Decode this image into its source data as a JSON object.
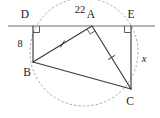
{
  "diagram": {
    "kind": "circle-geometry-figure",
    "background_color": "#ffffff",
    "stroke_color": "#3a3a3a",
    "dashed_color": "#9a9a9a",
    "label_color": "#1a1a1a",
    "vertices": [
      {
        "id": "D",
        "label": "D",
        "x": 33.0,
        "y": 26.0,
        "label_x": 25.0,
        "label_y": 15.0
      },
      {
        "id": "A",
        "label": "A",
        "x": 92.0,
        "y": 26.0,
        "label_x": 91.0,
        "label_y": 15.0
      },
      {
        "id": "E",
        "label": "E",
        "x": 131.0,
        "y": 26.0,
        "label_x": 131.0,
        "label_y": 15.0
      },
      {
        "id": "B",
        "label": "B",
        "x": 33.0,
        "y": 62.0,
        "label_x": 27.0,
        "label_y": 73.0
      },
      {
        "id": "C",
        "label": "C",
        "x": 131.0,
        "y": 89.0,
        "label_x": 130.0,
        "label_y": 102.0
      }
    ],
    "segments": [
      {
        "id": "DAE-baseline",
        "name": "baseline-through-D-A-E",
        "x1": 8.0,
        "y1": 26.0,
        "x2": 155.0,
        "y2": 26.0,
        "style": "baseline"
      },
      {
        "id": "DB",
        "name": "segment-DB",
        "x1": 33.0,
        "y1": 26.0,
        "x2": 33.0,
        "y2": 62.0,
        "style": "solid"
      },
      {
        "id": "EC",
        "name": "segment-EC",
        "x1": 131.0,
        "y1": 26.0,
        "x2": 131.0,
        "y2": 89.0,
        "style": "solid"
      },
      {
        "id": "AB",
        "name": "segment-AB",
        "x1": 92.0,
        "y1": 26.0,
        "x2": 33.0,
        "y2": 62.0,
        "style": "solid"
      },
      {
        "id": "AC",
        "name": "segment-AC",
        "x1": 92.0,
        "y1": 26.0,
        "x2": 131.0,
        "y2": 89.0,
        "style": "solid"
      },
      {
        "id": "BC",
        "name": "segment-BC",
        "x1": 33.0,
        "y1": 62.0,
        "x2": 131.0,
        "y2": 89.0,
        "style": "solid"
      }
    ],
    "arc": {
      "name": "circumscribing-dashed-arc",
      "center_x": 84.0,
      "center_y": 52.0,
      "radius": 54.0,
      "style": "dashed"
    },
    "right_angles": [
      {
        "id": "angle-D",
        "name": "right-angle-at-D",
        "x": 33.0,
        "y": 26.0,
        "dir_x": 1,
        "dir_y": 1,
        "size": 6.5
      },
      {
        "id": "angle-E",
        "name": "right-angle-at-E",
        "x": 131.0,
        "y": 26.0,
        "dir_x": -1,
        "dir_y": 1,
        "size": 6.5
      },
      {
        "id": "angle-A",
        "name": "right-angle-at-A",
        "x": 92.0,
        "y": 26.0,
        "size": 6.0
      }
    ],
    "congruence_ticks": [
      {
        "id": "tick-AB",
        "name": "congruence-tick-on-AB",
        "x": 62.5,
        "y": 44.0,
        "angle": 31.4
      },
      {
        "id": "tick-AC",
        "name": "congruence-tick-on-AC",
        "x": 111.5,
        "y": 57.5,
        "angle": 58.2
      }
    ],
    "measure_labels": [
      {
        "id": "label-22",
        "name": "measure-label-arc-DE",
        "text": "22",
        "x": 80.0,
        "y": 11.0,
        "italic": false
      },
      {
        "id": "label-8",
        "name": "measure-label-DB",
        "text": "8",
        "x": 20.0,
        "y": 45.0,
        "italic": false
      },
      {
        "id": "label-x",
        "name": "measure-label-EC",
        "text": "x",
        "x": 144.0,
        "y": 60.0,
        "italic": true
      }
    ]
  }
}
